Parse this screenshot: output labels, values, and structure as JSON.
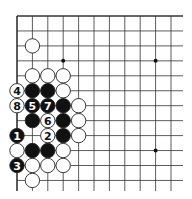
{
  "diagram": {
    "type": "go-board-fragment",
    "grid": {
      "x0": 17,
      "y0": 16,
      "dx": 15.4,
      "dy": 14.95,
      "cols": 11,
      "rows": 12,
      "extend_right": 183,
      "extend_bottom": 191
    },
    "edges": {
      "top": true,
      "left": true,
      "right": false,
      "bottom": false
    },
    "star_points": [
      {
        "c": 3,
        "r": 3
      },
      {
        "c": 9,
        "r": 3
      },
      {
        "c": 9,
        "r": 9
      }
    ],
    "stones": [
      {
        "c": 1,
        "r": 2,
        "color": "white"
      },
      {
        "c": 1,
        "r": 4,
        "color": "white"
      },
      {
        "c": 2,
        "r": 4,
        "color": "white"
      },
      {
        "c": 3,
        "r": 4,
        "color": "white"
      },
      {
        "c": 0,
        "r": 5,
        "color": "white",
        "label": "4"
      },
      {
        "c": 1,
        "r": 5,
        "color": "black"
      },
      {
        "c": 2,
        "r": 5,
        "color": "black"
      },
      {
        "c": 3,
        "r": 5,
        "color": "white"
      },
      {
        "c": 0,
        "r": 6,
        "color": "white",
        "label": "8"
      },
      {
        "c": 1,
        "r": 6,
        "color": "black",
        "label": "5"
      },
      {
        "c": 2,
        "r": 6,
        "color": "black",
        "label": "7"
      },
      {
        "c": 3,
        "r": 6,
        "color": "black"
      },
      {
        "c": 4,
        "r": 6,
        "color": "white"
      },
      {
        "c": 1,
        "r": 7,
        "color": "black"
      },
      {
        "c": 2,
        "r": 7,
        "color": "white",
        "label": "6"
      },
      {
        "c": 3,
        "r": 7,
        "color": "black"
      },
      {
        "c": 4,
        "r": 7,
        "color": "white"
      },
      {
        "c": 0,
        "r": 8,
        "color": "black",
        "label": "1"
      },
      {
        "c": 2,
        "r": 8,
        "color": "white",
        "label": "2"
      },
      {
        "c": 3,
        "r": 8,
        "color": "black"
      },
      {
        "c": 4,
        "r": 8,
        "color": "white"
      },
      {
        "c": 0,
        "r": 9,
        "color": "white"
      },
      {
        "c": 1,
        "r": 9,
        "color": "black"
      },
      {
        "c": 2,
        "r": 9,
        "color": "black"
      },
      {
        "c": 3,
        "r": 9,
        "color": "white"
      },
      {
        "c": 0,
        "r": 10,
        "color": "black",
        "label": "3"
      },
      {
        "c": 1,
        "r": 10,
        "color": "white"
      },
      {
        "c": 2,
        "r": 10,
        "color": "white"
      },
      {
        "c": 3,
        "r": 10,
        "color": "white"
      },
      {
        "c": 1,
        "r": 11,
        "color": "white"
      }
    ],
    "colors": {
      "line": "#333333",
      "black_stone": "#111111",
      "white_stone": "#ffffff",
      "stone_outline": "#222222"
    }
  }
}
